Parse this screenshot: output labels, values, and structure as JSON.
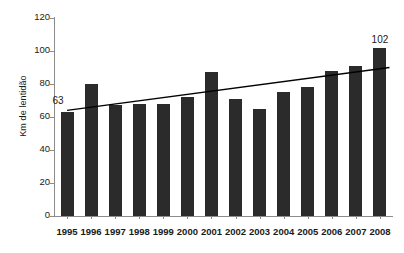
{
  "chart_data": {
    "type": "bar",
    "title": "",
    "subtitle": "",
    "xlabel": "",
    "ylabel": "Km de lentidão",
    "categories": [
      "1995",
      "1996",
      "1997",
      "1998",
      "1999",
      "2000",
      "2001",
      "2002",
      "2003",
      "2004",
      "2005",
      "2006",
      "2007",
      "2008"
    ],
    "values": [
      63,
      80,
      67,
      68,
      68,
      72,
      87,
      71,
      65,
      75,
      78,
      88,
      91,
      102
    ],
    "ylim": [
      0,
      120
    ],
    "ytick_values": [
      0,
      20,
      40,
      60,
      80,
      100,
      120
    ],
    "ytick_labels": [
      "0",
      "20",
      "40",
      "60",
      "80",
      "100",
      "120"
    ],
    "grid": false,
    "legend": false,
    "legend_position": "none",
    "bar_color": "#2b2b2b",
    "axis_color": "#8c8c8c",
    "background_color": "#ffffff",
    "annotations": [
      {
        "category": "1995",
        "value": 63,
        "label": "63"
      },
      {
        "category": "2008",
        "value": 102,
        "label": "102"
      }
    ],
    "series": [
      {
        "name": "Km de lentidão",
        "type": "bar",
        "values": [
          63,
          80,
          67,
          68,
          68,
          72,
          87,
          71,
          65,
          75,
          78,
          88,
          91,
          102
        ]
      },
      {
        "name": "trendline",
        "type": "line",
        "color": "#000000",
        "start_value": 64,
        "end_value": 90,
        "values": [
          64,
          66,
          68,
          70,
          72,
          74,
          76,
          78,
          80,
          82,
          84,
          86,
          88,
          90
        ]
      }
    ]
  }
}
